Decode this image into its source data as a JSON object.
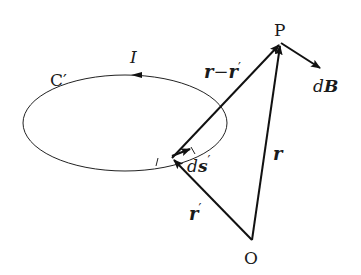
{
  "diagram": {
    "colors": {
      "stroke": "#111111",
      "background": "#ffffff"
    },
    "labels": {
      "loop": "C′",
      "current": "I",
      "point_p": "P",
      "origin": "O",
      "field_d": "d",
      "field_B": "B",
      "r_minus_r_prime_a": "r",
      "r_minus_r_prime_op": "−",
      "r_minus_r_prime_b": "r",
      "r_minus_r_prime_prime": "′",
      "r": "r",
      "r_prime": "r",
      "r_prime_mark": "′",
      "ds_d": "d",
      "ds_s": "s",
      "ds_prime": "′"
    },
    "points": {
      "P": [
        281,
        43
      ],
      "O": [
        252,
        240
      ],
      "source": [
        172,
        158
      ]
    }
  }
}
